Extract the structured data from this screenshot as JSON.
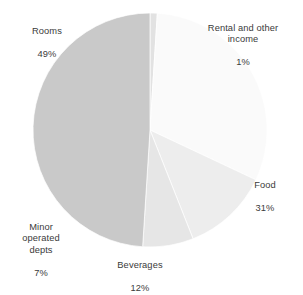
{
  "chart_data": {
    "type": "pie",
    "title": "",
    "subtitle": "",
    "xlabel": "",
    "ylabel": "",
    "legend": "none",
    "grid": false,
    "units": "percent",
    "start_angle_deg": 0,
    "direction": "clockwise",
    "center": {
      "x": 150,
      "y": 130
    },
    "radius": 117,
    "background_color": "#ffffff",
    "label_color": "#3a3a3a",
    "categories": [
      "Rental and other income",
      "Food",
      "Beverages",
      "Minor operated depts",
      "Rooms"
    ],
    "values": [
      1,
      31,
      12,
      7,
      49
    ],
    "slices": [
      {
        "name": "Rental and other income",
        "label_lines": "Rental and other\nincome",
        "value": 1,
        "value_label": "1%",
        "color": "#e2e2e2",
        "start_deg": 0,
        "end_deg": 3.6
      },
      {
        "name": "Food",
        "label_lines": "Food",
        "value": 31,
        "value_label": "31%",
        "color": "#fafafa",
        "start_deg": 3.6,
        "end_deg": 115.2
      },
      {
        "name": "Beverages",
        "label_lines": "Beverages",
        "value": 12,
        "value_label": "12%",
        "color": "#ededed",
        "start_deg": 115.2,
        "end_deg": 158.4
      },
      {
        "name": "Minor operated depts",
        "label_lines": "Minor\noperated\ndepts",
        "value": 7,
        "value_label": "7%",
        "color": "#e6e6e6",
        "start_deg": 158.4,
        "end_deg": 183.6
      },
      {
        "name": "Rooms",
        "label_lines": "Rooms",
        "value": 49,
        "value_label": "49%",
        "color": "#c9c9c9",
        "start_deg": 183.6,
        "end_deg": 360
      }
    ]
  },
  "labels": {
    "rooms": {
      "name": "Rooms",
      "value": "49%"
    },
    "rental": {
      "name": "Rental and other\nincome",
      "value": "1%"
    },
    "food": {
      "name": "Food",
      "value": "31%"
    },
    "beverages": {
      "name": "Beverages",
      "value": "12%"
    },
    "minor": {
      "name": "Minor\noperated\ndepts",
      "value": "7%"
    }
  }
}
